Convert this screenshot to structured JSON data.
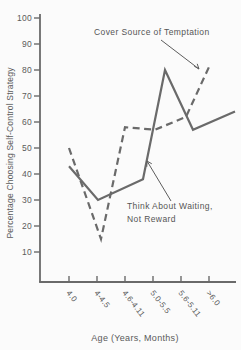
{
  "figure": {
    "background": "#fbfbfb",
    "ink_color": "#6a6a6a",
    "text_color": "#585858"
  },
  "chart_data": {
    "type": "line",
    "title": "",
    "xlabel": "Age (Years, Months)",
    "ylabel": "Percentage Choosing Self-Control Strategy",
    "ylim": [
      0,
      100
    ],
    "yticks": [
      10,
      20,
      30,
      40,
      50,
      60,
      70,
      80,
      90,
      100
    ],
    "categories": [
      "4.0",
      "4-4.5",
      "4.6-4.11",
      "5.0-5.5",
      "5.6-5.11",
      ">6.0"
    ],
    "series": [
      {
        "name": "Cover Source of Temptation",
        "style": "dashed",
        "values": [
          50,
          15,
          58,
          57,
          62,
          82
        ]
      },
      {
        "name": "Think About Waiting, Not Reward",
        "style": "solid",
        "values": [
          43,
          30,
          38,
          80,
          57,
          64
        ]
      }
    ],
    "grid": false,
    "legend_position": "in-plot annotations with arrows"
  },
  "annotations": {
    "cover_line1": "Cover Source of Temptation",
    "think_line1": "Think About Waiting,",
    "think_line2": "Not Reward"
  }
}
